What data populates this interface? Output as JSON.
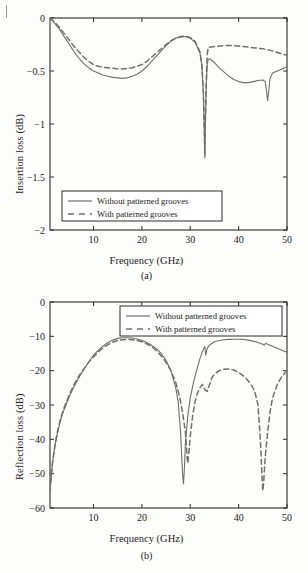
{
  "page": {
    "corner_mark": "page-margin-tick"
  },
  "figures": [
    {
      "id": "a",
      "subcaption": "(a)",
      "xlabel": "Frequency (GHz)",
      "ylabel": "Insertion loss (dB)"
    },
    {
      "id": "b",
      "subcaption": "(b)",
      "xlabel": "Frequency (GHz)",
      "ylabel": "Reflection loss (dB)"
    }
  ],
  "legend": {
    "solid": "Without patterned grooves",
    "dashed": "With patterned grooves"
  },
  "colors": {
    "axis": "#1a1a1a",
    "solid_curve": "#6f6f6f",
    "dashed_curve": "#6f6f6f",
    "frame": "#2a2a2a",
    "background": "#fdfdfc"
  },
  "chart_data": [
    {
      "type": "line",
      "id": "a",
      "title": "",
      "xlabel": "Frequency (GHz)",
      "ylabel": "Insertion loss (dB)",
      "xlim": [
        1,
        50
      ],
      "ylim": [
        -2,
        0
      ],
      "xticks": [
        10,
        20,
        30,
        40,
        50
      ],
      "yticks": [
        0,
        -0.5,
        -1,
        -1.5,
        -2
      ],
      "ytick_labels": [
        "0",
        "-0.5",
        "-1",
        "-1.5",
        "-2"
      ],
      "grid": false,
      "legend_position": "lower-left",
      "series": [
        {
          "name": "Without patterned grooves",
          "style": "solid",
          "x": [
            1,
            2,
            3,
            4,
            5,
            6,
            7,
            8,
            9,
            10,
            11,
            12,
            13,
            14,
            15,
            16,
            17,
            18,
            19,
            20,
            21,
            22,
            23,
            24,
            25,
            26,
            27,
            28,
            29,
            30,
            31,
            32,
            32.4,
            32.7,
            32.9,
            33.0,
            33.1,
            33.3,
            33.5,
            33.7,
            34,
            35,
            36,
            37,
            38,
            39,
            40,
            41,
            42,
            43,
            44,
            45,
            45.5,
            45.8,
            46.0,
            46.2,
            46.5,
            47,
            48,
            49,
            50
          ],
          "y": [
            0.0,
            -0.05,
            -0.11,
            -0.18,
            -0.25,
            -0.32,
            -0.38,
            -0.43,
            -0.47,
            -0.5,
            -0.52,
            -0.54,
            -0.55,
            -0.56,
            -0.565,
            -0.57,
            -0.565,
            -0.55,
            -0.53,
            -0.5,
            -0.46,
            -0.41,
            -0.36,
            -0.31,
            -0.26,
            -0.22,
            -0.19,
            -0.18,
            -0.175,
            -0.19,
            -0.23,
            -0.33,
            -0.45,
            -0.7,
            -1.05,
            -1.32,
            -1.05,
            -0.65,
            -0.45,
            -0.39,
            -0.385,
            -0.42,
            -0.47,
            -0.51,
            -0.55,
            -0.58,
            -0.6,
            -0.61,
            -0.61,
            -0.6,
            -0.59,
            -0.585,
            -0.6,
            -0.7,
            -0.78,
            -0.7,
            -0.57,
            -0.52,
            -0.5,
            -0.48,
            -0.46
          ]
        },
        {
          "name": "With patterned grooves",
          "style": "dashed",
          "x": [
            1,
            2,
            3,
            4,
            5,
            6,
            7,
            8,
            9,
            10,
            11,
            12,
            13,
            14,
            15,
            16,
            17,
            18,
            19,
            20,
            21,
            22,
            23,
            24,
            25,
            26,
            27,
            28,
            29,
            30,
            31,
            32,
            32.4,
            32.7,
            32.9,
            33.0,
            33.1,
            33.3,
            33.5,
            33.7,
            34,
            35,
            36,
            37,
            38,
            39,
            40,
            41,
            42,
            43,
            44,
            45,
            46,
            47,
            48,
            49,
            50
          ],
          "y": [
            0.0,
            -0.04,
            -0.09,
            -0.15,
            -0.21,
            -0.27,
            -0.32,
            -0.37,
            -0.41,
            -0.44,
            -0.455,
            -0.465,
            -0.47,
            -0.475,
            -0.48,
            -0.48,
            -0.475,
            -0.47,
            -0.455,
            -0.44,
            -0.41,
            -0.37,
            -0.33,
            -0.29,
            -0.25,
            -0.215,
            -0.19,
            -0.175,
            -0.17,
            -0.185,
            -0.22,
            -0.32,
            -0.44,
            -0.69,
            -1.04,
            -1.3,
            -1.02,
            -0.6,
            -0.35,
            -0.28,
            -0.275,
            -0.27,
            -0.265,
            -0.26,
            -0.26,
            -0.26,
            -0.265,
            -0.27,
            -0.275,
            -0.28,
            -0.285,
            -0.29,
            -0.3,
            -0.31,
            -0.325,
            -0.34,
            -0.35
          ]
        }
      ]
    },
    {
      "type": "line",
      "id": "b",
      "title": "",
      "xlabel": "Frequency (GHz)",
      "ylabel": "Reflection loss (dB)",
      "xlim": [
        1,
        50
      ],
      "ylim": [
        -60,
        0
      ],
      "xticks": [
        10,
        20,
        30,
        40,
        50
      ],
      "yticks": [
        0,
        -10,
        -20,
        -30,
        -40,
        -50,
        -60
      ],
      "ytick_labels": [
        "0",
        "-10",
        "-20",
        "-30",
        "-40",
        "-50",
        "-60"
      ],
      "grid": false,
      "legend_position": "upper-right",
      "series": [
        {
          "name": "Without patterned grooves",
          "style": "solid",
          "x": [
            1,
            1.5,
            2,
            2.5,
            3,
            3.5,
            4,
            5,
            6,
            7,
            8,
            9,
            10,
            11,
            12,
            13,
            14,
            15,
            16,
            17,
            18,
            19,
            20,
            21,
            22,
            23,
            24,
            25,
            26,
            27,
            27.5,
            28,
            28.2,
            28.4,
            28.6,
            28.8,
            29,
            29.5,
            30,
            30.5,
            31,
            31.5,
            32,
            32.4,
            32.8,
            33,
            33.2,
            33.5,
            34,
            35,
            36,
            37,
            38,
            39,
            40,
            41,
            42,
            43,
            44,
            45,
            45.3,
            45.6,
            46,
            47,
            48,
            49,
            50
          ],
          "y": [
            -55,
            -47,
            -42,
            -38.5,
            -35.5,
            -33,
            -31,
            -27.5,
            -24.5,
            -22,
            -19.5,
            -17.5,
            -15.5,
            -14,
            -12.8,
            -11.8,
            -11.1,
            -10.6,
            -10.4,
            -10.4,
            -10.5,
            -10.8,
            -11.2,
            -11.8,
            -12.6,
            -13.6,
            -15,
            -17,
            -20,
            -25,
            -29,
            -38,
            -44,
            -50,
            -53,
            -48,
            -41,
            -33,
            -28,
            -24.5,
            -21.5,
            -19,
            -16.5,
            -14.8,
            -13.5,
            -13,
            -15.5,
            -13.5,
            -12.5,
            -11.6,
            -11.2,
            -11,
            -10.9,
            -10.85,
            -10.85,
            -10.9,
            -11.1,
            -11.4,
            -11.8,
            -12.3,
            -12.6,
            -12.0,
            -12.3,
            -12.9,
            -13.5,
            -14.1,
            -14.6
          ]
        },
        {
          "name": "With patterned grooves",
          "style": "dashed",
          "x": [
            1,
            1.5,
            2,
            2.5,
            3,
            3.5,
            4,
            5,
            6,
            7,
            8,
            9,
            10,
            11,
            12,
            13,
            14,
            15,
            16,
            17,
            18,
            19,
            20,
            21,
            22,
            23,
            24,
            25,
            26,
            27,
            27.5,
            28,
            28.5,
            29,
            29.2,
            29.4,
            29.5,
            29.7,
            30,
            30.5,
            31,
            31.5,
            32,
            32.5,
            33,
            33.5,
            34,
            34.5,
            35,
            36,
            37,
            38,
            39,
            40,
            41,
            42,
            43,
            43.5,
            44,
            44.3,
            44.6,
            44.8,
            45,
            45.2,
            45.5,
            46,
            46.5,
            47,
            48,
            49,
            50
          ],
          "y": [
            -55,
            -47,
            -42,
            -38,
            -35,
            -32.5,
            -30.5,
            -27,
            -24,
            -21.5,
            -19.5,
            -17.5,
            -16,
            -14.5,
            -13.3,
            -12.4,
            -11.7,
            -11.2,
            -11,
            -10.9,
            -11,
            -11.2,
            -11.6,
            -12.2,
            -13,
            -14.2,
            -15.7,
            -17.6,
            -20,
            -23.5,
            -26,
            -29,
            -33,
            -38,
            -42,
            -46,
            -47,
            -44,
            -39,
            -33,
            -29,
            -26.5,
            -25,
            -24,
            -25.5,
            -26,
            -24,
            -22,
            -21,
            -20,
            -19.6,
            -19.5,
            -19.8,
            -20.5,
            -21.5,
            -23,
            -25,
            -27,
            -30,
            -36,
            -43,
            -50,
            -55,
            -52,
            -45,
            -38,
            -32,
            -28,
            -24,
            -21.5,
            -20
          ]
        }
      ]
    }
  ]
}
